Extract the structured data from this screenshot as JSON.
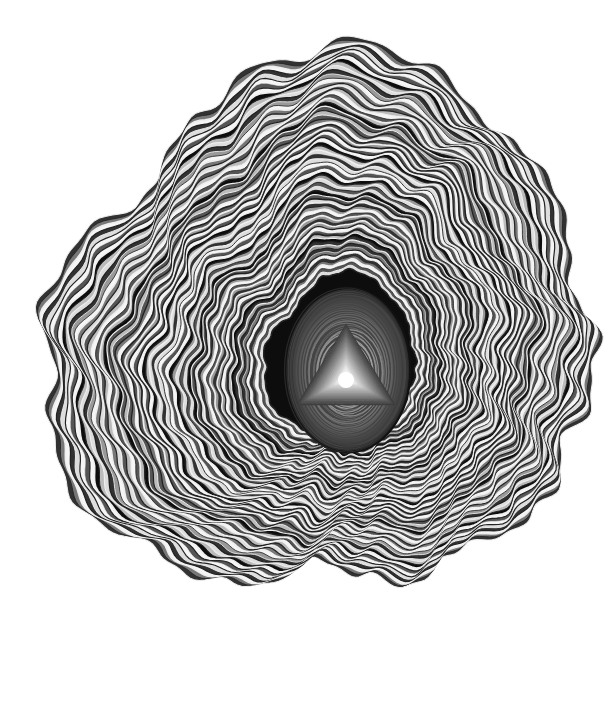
{
  "artwork": {
    "subject": "concentric wavy grayscale rings forming an agate/tree-ring-like shape with a triangular core",
    "background": "#ffffff",
    "palette": [
      "#111111",
      "#333333",
      "#555555",
      "#777777",
      "#999999",
      "#bbbbbb",
      "#dddddd",
      "#f5f5f5"
    ],
    "center": [
      348,
      368
    ],
    "core_shape": "triangle",
    "core_ellipse": {
      "cx": 348,
      "cy": 370,
      "rx": 62,
      "ry": 82
    }
  }
}
